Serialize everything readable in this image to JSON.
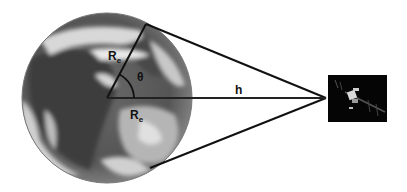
{
  "diagram": {
    "type": "satellite-earth-geometry",
    "labels": {
      "radius_upper": "R",
      "radius_upper_sub": "e",
      "radius_lower": "R",
      "radius_lower_sub": "e",
      "angle": "θ",
      "altitude": "h"
    },
    "elements": {
      "earth": {
        "shape": "circle",
        "cx": 107,
        "cy": 98,
        "r": 85
      },
      "satellite": {
        "shape": "rect",
        "x": 328,
        "y": 75,
        "width": 59,
        "height": 47,
        "apex": [
          326,
          98
        ]
      },
      "tangent_top": [
        [
          146,
          24
        ],
        [
          326,
          98
        ]
      ],
      "tangent_bottom": [
        [
          150,
          168
        ],
        [
          326,
          98
        ]
      ],
      "radius_to_tangent": [
        [
          107,
          98
        ],
        [
          146,
          24
        ]
      ],
      "center_line": [
        [
          107,
          98
        ],
        [
          326,
          98
        ]
      ]
    },
    "colors": {
      "lines": "#111111",
      "background": "#ffffff",
      "satellite_box": "#050505"
    }
  }
}
